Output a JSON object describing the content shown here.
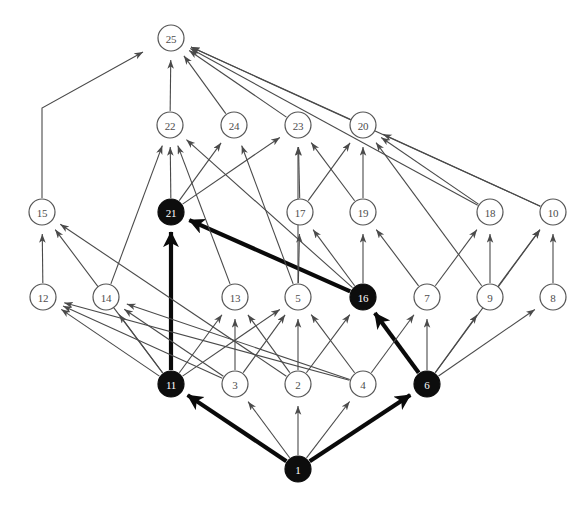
{
  "figure": {
    "background_color": "#ffffff",
    "node_fill_open": "#ffffff",
    "node_fill_highlight": "#0d0d0d",
    "node_stroke": "#555555",
    "label_color_open": "#4d4d4d",
    "label_color_highlight": "#ffffff",
    "edge_color_thin": "#4a4a4a",
    "edge_color_thick": "#0a0a0a",
    "node_radius": 13
  },
  "nodes": [
    {
      "id": "1",
      "label": "1",
      "x": 298,
      "y": 469,
      "highlighted": true
    },
    {
      "id": "2",
      "label": "2",
      "x": 298,
      "y": 384,
      "highlighted": false
    },
    {
      "id": "3",
      "label": "3",
      "x": 235,
      "y": 384,
      "highlighted": false
    },
    {
      "id": "4",
      "label": "4",
      "x": 363,
      "y": 384,
      "highlighted": false
    },
    {
      "id": "5",
      "label": "5",
      "x": 298,
      "y": 297,
      "highlighted": false
    },
    {
      "id": "6",
      "label": "6",
      "x": 427,
      "y": 384,
      "highlighted": true
    },
    {
      "id": "7",
      "label": "7",
      "x": 427,
      "y": 297,
      "highlighted": false
    },
    {
      "id": "8",
      "label": "8",
      "x": 553,
      "y": 297,
      "highlighted": false
    },
    {
      "id": "9",
      "label": "9",
      "x": 490,
      "y": 297,
      "highlighted": false
    },
    {
      "id": "10",
      "label": "10",
      "x": 553,
      "y": 212,
      "highlighted": false
    },
    {
      "id": "11",
      "label": "11",
      "x": 171,
      "y": 384,
      "highlighted": true
    },
    {
      "id": "12",
      "label": "12",
      "x": 43,
      "y": 297,
      "highlighted": false
    },
    {
      "id": "13",
      "label": "13",
      "x": 235,
      "y": 297,
      "highlighted": false
    },
    {
      "id": "14",
      "label": "14",
      "x": 106,
      "y": 297,
      "highlighted": false
    },
    {
      "id": "15",
      "label": "15",
      "x": 42,
      "y": 212,
      "highlighted": false
    },
    {
      "id": "16",
      "label": "16",
      "x": 363,
      "y": 297,
      "highlighted": true
    },
    {
      "id": "17",
      "label": "17",
      "x": 300,
      "y": 212,
      "highlighted": false
    },
    {
      "id": "18",
      "label": "18",
      "x": 490,
      "y": 212,
      "highlighted": false
    },
    {
      "id": "19",
      "label": "19",
      "x": 363,
      "y": 212,
      "highlighted": false
    },
    {
      "id": "20",
      "label": "20",
      "x": 363,
      "y": 125,
      "highlighted": false
    },
    {
      "id": "21",
      "label": "21",
      "x": 171,
      "y": 212,
      "highlighted": true
    },
    {
      "id": "22",
      "label": "22",
      "x": 170,
      "y": 125,
      "highlighted": false
    },
    {
      "id": "23",
      "label": "23",
      "x": 298,
      "y": 125,
      "highlighted": false
    },
    {
      "id": "24",
      "label": "24",
      "x": 234,
      "y": 125,
      "highlighted": false
    },
    {
      "id": "25",
      "label": "25",
      "x": 171,
      "y": 38,
      "highlighted": false
    }
  ],
  "edges": [
    {
      "from": "1",
      "to": "11",
      "weight": "thick"
    },
    {
      "from": "1",
      "to": "6",
      "weight": "thick"
    },
    {
      "from": "1",
      "to": "3",
      "weight": "thin"
    },
    {
      "from": "1",
      "to": "2",
      "weight": "thin"
    },
    {
      "from": "1",
      "to": "4",
      "weight": "thin"
    },
    {
      "from": "11",
      "to": "21",
      "weight": "thick"
    },
    {
      "from": "6",
      "to": "16",
      "weight": "thick"
    },
    {
      "from": "16",
      "to": "21",
      "weight": "thick"
    },
    {
      "from": "11",
      "to": "12",
      "weight": "thin"
    },
    {
      "from": "11",
      "to": "14",
      "weight": "thin"
    },
    {
      "from": "11",
      "to": "15",
      "weight": "thin"
    },
    {
      "from": "11",
      "to": "13",
      "weight": "thin"
    },
    {
      "from": "11",
      "to": "5",
      "weight": "thin"
    },
    {
      "from": "3",
      "to": "13",
      "weight": "thin"
    },
    {
      "from": "3",
      "to": "5",
      "weight": "thin"
    },
    {
      "from": "3",
      "to": "14",
      "weight": "thin"
    },
    {
      "from": "3",
      "to": "12",
      "weight": "thin"
    },
    {
      "from": "2",
      "to": "5",
      "weight": "thin"
    },
    {
      "from": "2",
      "to": "13",
      "weight": "thin"
    },
    {
      "from": "2",
      "to": "15",
      "weight": "thin"
    },
    {
      "from": "2",
      "to": "16",
      "weight": "thin"
    },
    {
      "from": "4",
      "to": "5",
      "weight": "thin"
    },
    {
      "from": "4",
      "to": "7",
      "weight": "thin"
    },
    {
      "from": "4",
      "to": "12",
      "weight": "thin"
    },
    {
      "from": "4",
      "to": "14",
      "weight": "thin"
    },
    {
      "from": "6",
      "to": "7",
      "weight": "thin"
    },
    {
      "from": "6",
      "to": "9",
      "weight": "thin"
    },
    {
      "from": "6",
      "to": "8",
      "weight": "thin"
    },
    {
      "from": "6",
      "to": "10",
      "weight": "thin"
    },
    {
      "from": "12",
      "to": "15",
      "weight": "thin"
    },
    {
      "from": "14",
      "to": "22",
      "weight": "thin"
    },
    {
      "from": "13",
      "to": "22",
      "weight": "thin"
    },
    {
      "from": "5",
      "to": "24",
      "weight": "thin"
    },
    {
      "from": "5",
      "to": "23",
      "weight": "thin"
    },
    {
      "from": "5",
      "to": "17",
      "weight": "thin"
    },
    {
      "from": "16",
      "to": "17",
      "weight": "thin"
    },
    {
      "from": "16",
      "to": "19",
      "weight": "thin"
    },
    {
      "from": "16",
      "to": "22",
      "weight": "thin"
    },
    {
      "from": "7",
      "to": "19",
      "weight": "thin"
    },
    {
      "from": "7",
      "to": "18",
      "weight": "thin"
    },
    {
      "from": "9",
      "to": "18",
      "weight": "thin"
    },
    {
      "from": "9",
      "to": "10",
      "weight": "thin"
    },
    {
      "from": "8",
      "to": "10",
      "weight": "thin"
    },
    {
      "from": "9",
      "to": "20",
      "weight": "thin"
    },
    {
      "from": "21",
      "to": "22",
      "weight": "thin"
    },
    {
      "from": "21",
      "to": "24",
      "weight": "thin"
    },
    {
      "from": "21",
      "to": "23",
      "weight": "thin"
    },
    {
      "from": "17",
      "to": "23",
      "weight": "thin"
    },
    {
      "from": "17",
      "to": "20",
      "weight": "thin"
    },
    {
      "from": "19",
      "to": "20",
      "weight": "thin"
    },
    {
      "from": "19",
      "to": "23",
      "weight": "thin"
    },
    {
      "from": "18",
      "to": "20",
      "weight": "thin"
    },
    {
      "from": "10",
      "to": "20",
      "weight": "thin"
    },
    {
      "from": "22",
      "to": "25",
      "weight": "thin"
    },
    {
      "from": "24",
      "to": "25",
      "weight": "thin"
    },
    {
      "from": "23",
      "to": "25",
      "weight": "thin"
    },
    {
      "from": "20",
      "to": "25",
      "weight": "thin"
    },
    {
      "from": "10",
      "to": "25",
      "weight": "thin"
    },
    {
      "from": "18",
      "to": "25",
      "weight": "thin"
    }
  ],
  "orthogonal_edges": [
    {
      "from": "15",
      "to": "25",
      "weight": "thin",
      "route": "elbow-up-right"
    }
  ]
}
